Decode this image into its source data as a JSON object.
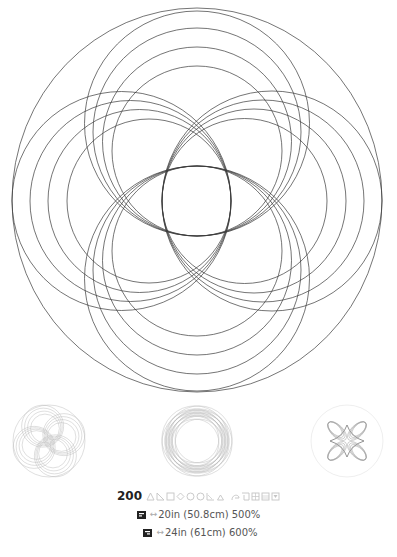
{
  "design": {
    "name": "main-design-preview",
    "stroke_color": "#3a3a3a",
    "outer_circle": {
      "cx": 197,
      "cy": 200,
      "rx": 185,
      "ry": 192
    },
    "lobe_families": [
      "top",
      "bottom",
      "left",
      "right"
    ],
    "circles_per_family": 4
  },
  "thumbnails": [
    {
      "label": "swirl-variant",
      "stroke_color": "#b8b8b8"
    },
    {
      "label": "ring-variant",
      "stroke_color": "#b8b8b8"
    },
    {
      "label": "star-variant",
      "stroke_color": "#9a9a9a"
    }
  ],
  "info": {
    "stitch_count": "200",
    "tool_icons": [
      "triangle-icon",
      "right-triangle-icon",
      "square-icon",
      "diamond-icon",
      "circle-icon",
      "circle-outline-icon",
      "corner-triangle-icon",
      "small-triangle-icon",
      "loop-icon",
      "crop-icon",
      "grid-icon",
      "grid-small-icon",
      "fill-icon"
    ],
    "icon_color": "#c4c4c4",
    "hoops": [
      {
        "arrow": "↔",
        "text": "20in (50.8cm) 500%"
      },
      {
        "arrow": "↔",
        "text": "24in (61cm) 600%"
      }
    ]
  }
}
